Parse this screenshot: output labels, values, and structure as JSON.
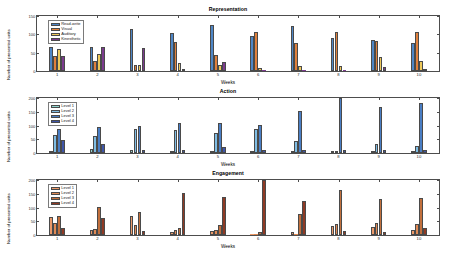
{
  "figure": {
    "panel_count": 3
  },
  "chart_data": [
    {
      "type": "bar",
      "title": "Representation",
      "xlabel": "Weeks",
      "ylabel": "Number of presented units",
      "categories": [
        "1",
        "2",
        "3",
        "4",
        "5",
        "6",
        "7",
        "8",
        "9",
        "10"
      ],
      "ylim": [
        0,
        150
      ],
      "yticks": [
        0,
        50,
        100,
        150
      ],
      "grid": false,
      "legend_position": "upper-left",
      "series": [
        {
          "name": "Read-write",
          "color": "#4e86c6",
          "values": [
            62,
            62,
            110,
            99,
            122,
            91,
            119,
            88,
            81,
            73
          ]
        },
        {
          "name": "Visual",
          "color": "#e0803c",
          "values": [
            39,
            27,
            16,
            77,
            43,
            103,
            74,
            102,
            79,
            102
          ]
        },
        {
          "name": "Auditory",
          "color": "#eec95a",
          "values": [
            58,
            46,
            15,
            21,
            16,
            9,
            12,
            13,
            36,
            26
          ]
        },
        {
          "name": "Kinesthetic",
          "color": "#7b3b8e",
          "values": [
            40,
            62,
            60,
            6,
            25,
            0,
            0,
            0,
            11,
            5
          ]
        }
      ]
    },
    {
      "type": "bar",
      "title": "Action",
      "xlabel": "Weeks",
      "ylabel": "Number of presented units",
      "categories": [
        "1",
        "2",
        "3",
        "4",
        "5",
        "6",
        "7",
        "8",
        "9",
        "10"
      ],
      "ylim": [
        0,
        200
      ],
      "yticks": [
        0,
        50,
        100,
        150,
        200
      ],
      "grid": false,
      "legend_position": "upper-left",
      "series": [
        {
          "name": "Level 1",
          "color": "#8fd4cd",
          "values": [
            5,
            15,
            10,
            6,
            6,
            6,
            4,
            3,
            3,
            3
          ]
        },
        {
          "name": "Level 2",
          "color": "#7fbde4",
          "values": [
            64,
            61,
            84,
            81,
            71,
            86,
            42,
            3,
            31,
            23
          ]
        },
        {
          "name": "Level 3",
          "color": "#4a7ec4",
          "values": [
            83,
            90,
            95,
            105,
            105,
            100,
            148,
            194,
            160,
            174
          ]
        },
        {
          "name": "Level 4",
          "color": "#3f55a8",
          "values": [
            44,
            31,
            10,
            11,
            21,
            12,
            10,
            9,
            12,
            10
          ]
        }
      ]
    },
    {
      "type": "bar",
      "title": "Engagement",
      "xlabel": "Weeks",
      "ylabel": "Number of presented units",
      "categories": [
        "1",
        "2",
        "3",
        "4",
        "5",
        "6",
        "7",
        "8",
        "9",
        "10"
      ],
      "ylim": [
        0,
        200
      ],
      "yticks": [
        0,
        50,
        100,
        150,
        200
      ],
      "grid": false,
      "legend_position": "upper-left",
      "series": [
        {
          "name": "Level 1",
          "color": "#ec9a6a",
          "values": [
            64,
            18,
            68,
            12,
            14,
            0,
            11,
            31,
            28,
            16
          ]
        },
        {
          "name": "Level 2",
          "color": "#e08a55",
          "values": [
            43,
            22,
            35,
            17,
            19,
            0,
            0,
            38,
            43,
            38
          ]
        },
        {
          "name": "Level 3",
          "color": "#c2703d",
          "values": [
            65,
            99,
            81,
            24,
            36,
            12,
            74,
            158,
            126,
            129
          ]
        },
        {
          "name": "Level 4",
          "color": "#8f3a24",
          "values": [
            26,
            60,
            14,
            148,
            132,
            192,
            120,
            15,
            10,
            24
          ]
        }
      ]
    }
  ]
}
